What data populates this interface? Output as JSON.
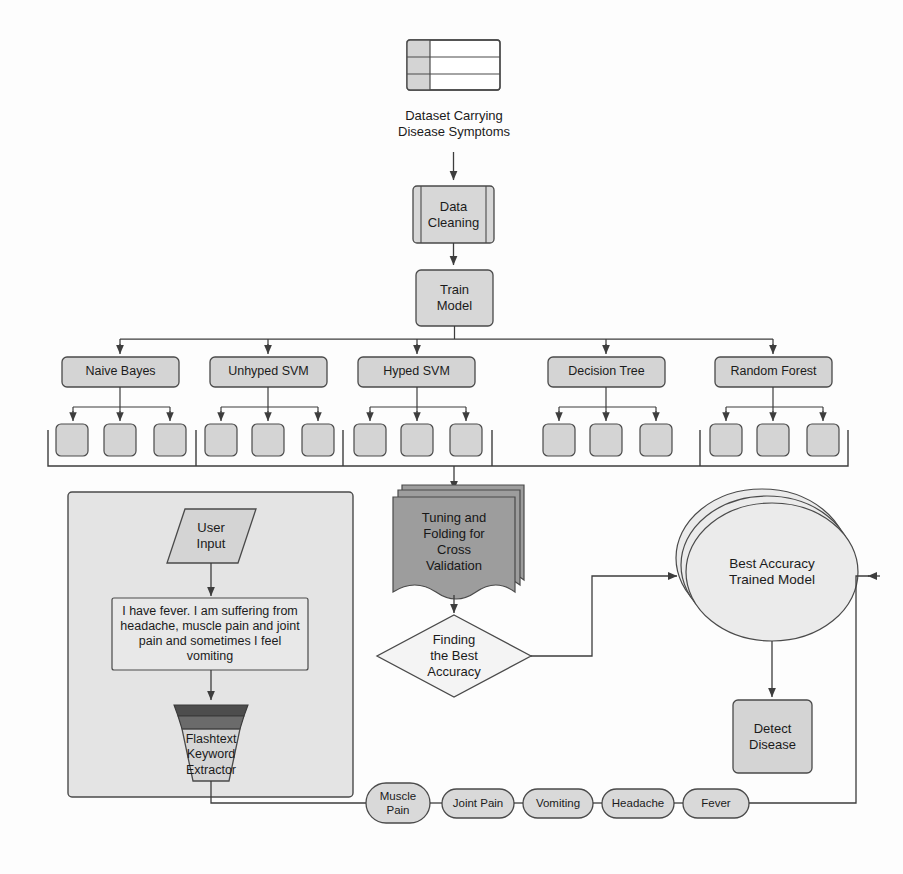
{
  "diagram": {
    "colors": {
      "box_fill": "#d4d4d4",
      "box_fill_light": "#dcdcdc",
      "panel_fill": "#e4e4e4",
      "stack_dark": "#9a9a9a",
      "funnel_dark": "#5a5a5a",
      "funnel_mid": "#6f6f6f",
      "diamond_fill": "#f4f4f4",
      "circle_fill": "#ececec",
      "stroke": "#4a4a4a",
      "text": "#1b1b1b"
    },
    "dataset": {
      "icon": "table-icon",
      "caption": "Dataset Carrying\nDisease Symptoms"
    },
    "data_cleaning": {
      "label": "Data\nCleaning"
    },
    "train_model": {
      "label": "Train\nModel"
    },
    "classifiers": [
      {
        "label": "Naive Bayes",
        "children": 3
      },
      {
        "label": "Unhyped SVM",
        "children": 3
      },
      {
        "label": "Hyped SVM",
        "children": 3
      },
      {
        "label": "Decision Tree",
        "children": 3
      },
      {
        "label": "Random Forest",
        "children": 3
      }
    ],
    "tuning": {
      "label": "Tuning and\nFolding for\nCross\nValidation"
    },
    "finding_best": {
      "label": "Finding\nthe Best\nAccuracy"
    },
    "best_model": {
      "label": "Best Accuracy\nTrained Model"
    },
    "detect_disease": {
      "label": "Detect\nDisease"
    },
    "user_panel": {
      "user_input": {
        "label": "User\nInput"
      },
      "statement": "I have fever. I am suffering from headache, muscle pain and joint pain and sometimes I feel vomiting",
      "extractor": {
        "label": "Flashtext\nKeyword\nExtractor"
      }
    },
    "symptoms": [
      {
        "label": "Muscle\nPain"
      },
      {
        "label": "Joint Pain"
      },
      {
        "label": "Vomiting"
      },
      {
        "label": "Headache"
      },
      {
        "label": "Fever"
      }
    ]
  }
}
